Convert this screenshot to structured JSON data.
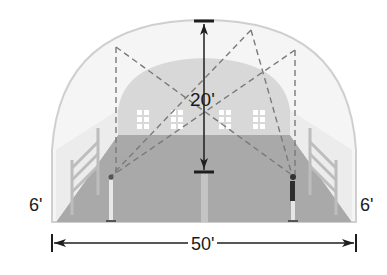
{
  "diagram": {
    "type": "dimensioned illustration of a domed indoor court with two people and dashed sight lines",
    "labels": {
      "height": "20'",
      "left_wall": "6'",
      "right_wall": "6'",
      "width": "50'"
    },
    "colors": {
      "dome_outline": "#cfcfcf",
      "dome_fill": "#f4f4f4",
      "back_wall": "#d9d9d9",
      "floor": "#a8a8a8",
      "window": "#ffffff",
      "dashed_line": "#777777",
      "dimension_line": "#222222"
    }
  }
}
